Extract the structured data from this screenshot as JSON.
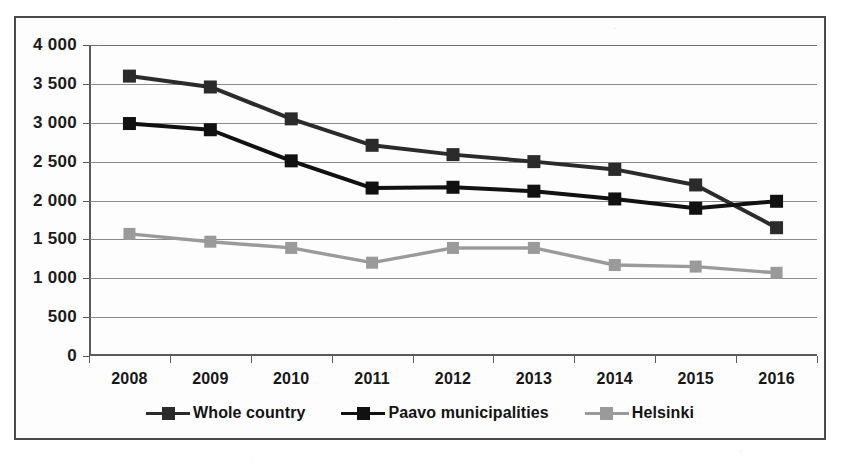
{
  "figure": {
    "border_color": "#4a4a4a",
    "background": "#fdfdfd"
  },
  "chart_data": {
    "type": "line",
    "title": "",
    "subtitle": "",
    "xlabel": "",
    "ylabel": "",
    "categories": [
      "2008",
      "2009",
      "2010",
      "2011",
      "2012",
      "2013",
      "2014",
      "2015",
      "2016"
    ],
    "x": [
      2008,
      2009,
      2010,
      2011,
      2012,
      2013,
      2014,
      2015,
      2016
    ],
    "ylim": [
      0,
      4000
    ],
    "ytick_values": [
      0,
      500,
      1000,
      1500,
      2000,
      2500,
      3000,
      3500,
      4000
    ],
    "ytick_labels": [
      "0",
      "500",
      "1 000",
      "1 500",
      "2 000",
      "2 500",
      "3 000",
      "3 500",
      "4 000"
    ],
    "grid": "horizontal",
    "legend_position": "bottom",
    "series": [
      {
        "name": "Whole country",
        "color": "#2b2b2b",
        "marker": "square",
        "values": [
          3600,
          3460,
          3050,
          2710,
          2590,
          2500,
          2400,
          2200,
          1650
        ]
      },
      {
        "name": "Paavo municipalities",
        "color": "#111111",
        "marker": "square",
        "values": [
          2990,
          2910,
          2510,
          2160,
          2170,
          2120,
          2020,
          1900,
          1990
        ]
      },
      {
        "name": "Helsinki",
        "color": "#9a9a9a",
        "marker": "square",
        "values": [
          1570,
          1470,
          1390,
          1200,
          1390,
          1390,
          1170,
          1150,
          1070
        ]
      }
    ]
  },
  "legend": {
    "items": [
      {
        "label": "Whole country",
        "color": "#2b2b2b"
      },
      {
        "label": "Paavo municipalities",
        "color": "#111111"
      },
      {
        "label": "Helsinki",
        "color": "#9a9a9a"
      }
    ]
  }
}
